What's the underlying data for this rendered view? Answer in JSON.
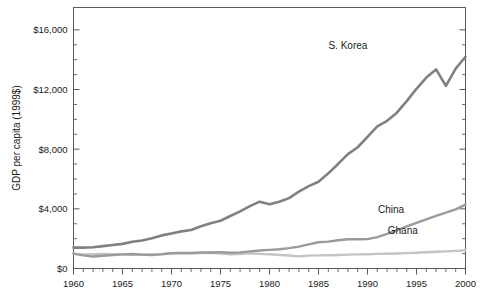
{
  "chart_data": {
    "type": "line",
    "title": "",
    "subtitle": "",
    "xlabel": "",
    "ylabel": "GDP per capita (1999$)",
    "xlim": [
      1960,
      2000
    ],
    "ylim": [
      0,
      17500
    ],
    "grid": false,
    "legend_position": "inline-right-of-line",
    "y_ticks": [
      0,
      4000,
      8000,
      12000,
      16000
    ],
    "y_tick_labels": [
      "$0",
      "$4,000",
      "$8,000",
      "$12,000",
      "$16,000"
    ],
    "y_minor_tick_interval": 1000,
    "x_ticks": [
      1960,
      1965,
      1970,
      1975,
      1980,
      1985,
      1990,
      1995,
      2000
    ],
    "x_tick_labels": [
      "1960",
      "1965",
      "1970",
      "1975",
      "1980",
      "1985",
      "1990",
      "1995",
      "2000"
    ],
    "x_minor_tick_interval": 1,
    "x": [
      1960,
      1961,
      1962,
      1963,
      1964,
      1965,
      1966,
      1967,
      1968,
      1969,
      1970,
      1971,
      1972,
      1973,
      1974,
      1975,
      1976,
      1977,
      1978,
      1979,
      1980,
      1981,
      1982,
      1983,
      1984,
      1985,
      1986,
      1987,
      1988,
      1989,
      1990,
      1991,
      1992,
      1993,
      1994,
      1995,
      1996,
      1997,
      1998,
      1999,
      2000
    ],
    "series": [
      {
        "name": "S. Korea",
        "color": "#808080",
        "line_width": 2.6,
        "label_x": 1988.0,
        "label_y": 14750,
        "values": [
          1400,
          1400,
          1420,
          1500,
          1580,
          1650,
          1790,
          1880,
          2030,
          2220,
          2350,
          2490,
          2580,
          2830,
          3030,
          3200,
          3520,
          3830,
          4180,
          4480,
          4300,
          4480,
          4720,
          5150,
          5520,
          5820,
          6380,
          7010,
          7670,
          8130,
          8830,
          9530,
          9900,
          10450,
          11220,
          12050,
          12800,
          13350,
          12250,
          13400,
          14200
        ]
      },
      {
        "name": "China",
        "color": "#9a9a9a",
        "line_width": 2.4,
        "label_x": 1992.4,
        "label_y": 3750,
        "values": [
          1000,
          880,
          800,
          850,
          900,
          950,
          970,
          930,
          900,
          950,
          1020,
          1050,
          1040,
          1080,
          1070,
          1100,
          1060,
          1080,
          1150,
          1210,
          1250,
          1290,
          1370,
          1470,
          1620,
          1760,
          1800,
          1890,
          1960,
          1960,
          1970,
          2100,
          2320,
          2560,
          2820,
          3060,
          3300,
          3530,
          3740,
          3960,
          4280
        ]
      },
      {
        "name": "Ghana",
        "color": "#c4c4c4",
        "line_width": 2.4,
        "label_x": 1993.6,
        "label_y": 2280,
        "values": [
          980,
          950,
          960,
          970,
          960,
          950,
          920,
          930,
          960,
          980,
          1020,
          1040,
          1010,
          1030,
          1060,
          1000,
          960,
          970,
          1020,
          980,
          960,
          910,
          870,
          810,
          860,
          880,
          890,
          910,
          930,
          950,
          960,
          980,
          990,
          1010,
          1030,
          1060,
          1090,
          1120,
          1150,
          1180,
          1220
        ]
      }
    ]
  },
  "axis": {
    "y_title": "GDP per capita (1999$)"
  }
}
